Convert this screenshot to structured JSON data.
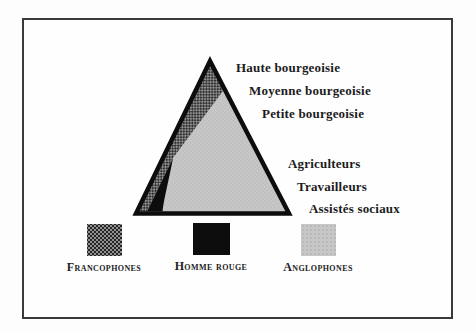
{
  "figure": {
    "type": "social-pyramid-diagram",
    "background_color": "#fdfdfd",
    "frame_border_color": "#3a3a3a"
  },
  "pyramid": {
    "outline_color": "#0d0d0d",
    "body_fill_color": "#c7c7c7",
    "hatch_band_color": "#8f8f8f",
    "black_sliver_color": "#0d0d0d",
    "classes": [
      "Haute bourgeoisie",
      "Moyenne bourgeoisie",
      "Petite bourgeoisie",
      "Agriculteurs",
      "Travailleurs",
      "Assistés sociaux"
    ]
  },
  "legend": {
    "items": [
      {
        "label": "Francophones",
        "swatch": "hatched-dark-gray",
        "color": "#8f8f8f"
      },
      {
        "label": "Homme rouge",
        "swatch": "solid-black",
        "color": "#0d0d0d"
      },
      {
        "label": "Anglophones",
        "swatch": "dotted-light-gray",
        "color": "#c7c7c7"
      }
    ]
  }
}
